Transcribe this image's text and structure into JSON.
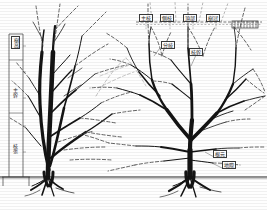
{
  "figure": {
    "type": "botanical-comparison-diagram",
    "background_color": "#fefefe",
    "ink_color": "#1a1a1a",
    "ground_line_y": 177,
    "panels": [
      {
        "id": "left-panel",
        "name": "narrow-upright-tree",
        "description": "Narrow upright tree form with vertical height scale at left"
      },
      {
        "id": "right-panel",
        "name": "wide-spreading-tree",
        "description": "Wide spreading tree form with horizontal reference line and callout labels"
      }
    ]
  },
  "scale_bar": {
    "name": "vertical-height-scale",
    "x": 10,
    "top_y": 36,
    "bottom_y": 177,
    "header_label": "樹高",
    "segment_labels": [
      "主幹",
      "枝張"
    ],
    "tick_positions": [
      36,
      88,
      140,
      177
    ]
  },
  "reference_line": {
    "name": "horizontal-dashed-reference",
    "y": 22,
    "x_start": 136,
    "x_end": 262,
    "style": "dashed"
  },
  "legend": {
    "name": "hatched-legend-box",
    "x": 232,
    "y": 21,
    "width": 26,
    "height": 7,
    "hatch": "vertical-ticks",
    "label": ""
  },
  "callouts": [
    {
      "id": "c1",
      "text": "主枝",
      "x": 139,
      "y": 16,
      "boxed": true
    },
    {
      "id": "c2",
      "text": "側枝",
      "x": 160,
      "y": 16,
      "boxed": true
    },
    {
      "id": "c3",
      "text": "頂部",
      "x": 183,
      "y": 16,
      "boxed": true
    },
    {
      "id": "c4",
      "text": "樹冠",
      "x": 206,
      "y": 16,
      "boxed": true
    },
    {
      "id": "c5",
      "text": "分岐",
      "x": 164,
      "y": 43,
      "boxed": true
    },
    {
      "id": "c6",
      "text": "枝幹",
      "x": 192,
      "y": 50,
      "boxed": true
    },
    {
      "id": "c7",
      "text": "根元",
      "x": 215,
      "y": 152,
      "boxed": true
    },
    {
      "id": "c8",
      "text": "地際",
      "x": 224,
      "y": 163,
      "boxed": true
    }
  ],
  "trees": {
    "left": {
      "name": "upright-tree",
      "trunk_base_x": 48,
      "trunk_base_y": 177,
      "apex_y": 24,
      "form": "narrow-erect",
      "solid_branches": "current form",
      "dashed_branches": "pruned or projected growth"
    },
    "right": {
      "name": "spreading-tree",
      "trunk_base_x": 190,
      "trunk_base_y": 177,
      "apex_y": 26,
      "form": "broad-spreading",
      "solid_branches": "current form",
      "dashed_branches": "pruned or projected growth"
    }
  }
}
